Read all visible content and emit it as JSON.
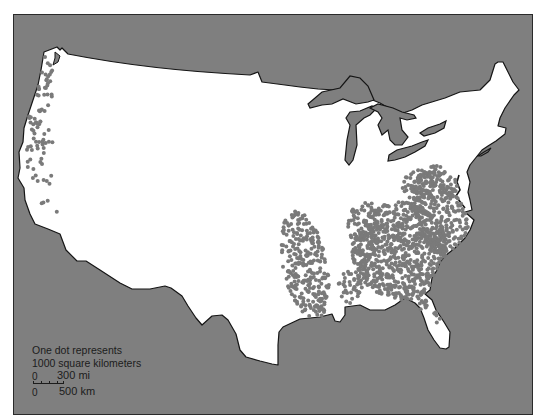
{
  "map": {
    "subject": "Contiguous United States dot-distribution map",
    "colors": {
      "background_water": "#7f7f7f",
      "land": "#ffffff",
      "dot": "#7a7a7a",
      "outline": "#1a1a1a",
      "page": "#ffffff"
    },
    "regions_with_dots": [
      "Pacific Northwest coast",
      "Northern California coast",
      "Lower Mississippi valley",
      "Southeast / Appalachian / Atlantic coastal plain",
      "Florida"
    ],
    "legend": {
      "line1": "One dot represents",
      "line2": "1000 square kilometers",
      "scale_zero_mi": "0",
      "scale_mi": "300 mi",
      "scale_zero_km": "0",
      "scale_km": "500 km"
    }
  }
}
